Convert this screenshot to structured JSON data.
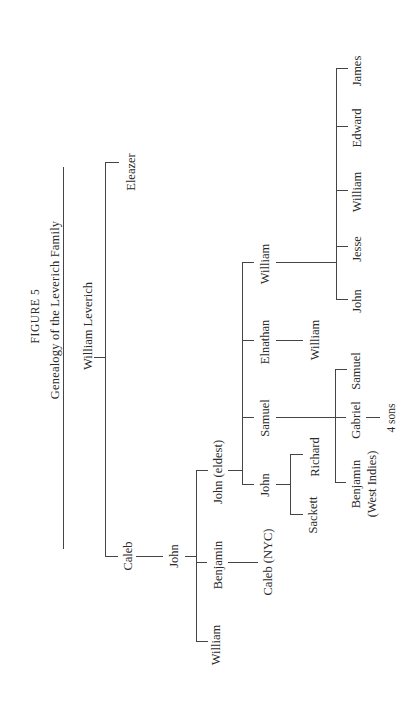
{
  "figure": {
    "number_label": "FIGURE 5",
    "title": "Genealogy of the Leverich Family",
    "orientation": "rotated 90° counter-clockwise"
  },
  "people": {
    "root": "William Leverich",
    "eleazer": "Eleazer",
    "caleb": "Caleb",
    "john_gen3": "John",
    "william_gen4": "William",
    "benjamin_gen4": "Benjamin",
    "caleb_nyc": "Caleb (NYC)",
    "john_eldest": "John (eldest)",
    "john_gen5": "John",
    "sackett": "Sackett",
    "richard": "Richard",
    "samuel_gen5": "Samuel",
    "benjamin_wi_line1": "Benjamin",
    "benjamin_wi_line2": "(West Indies)",
    "gabriel": "Gabriel",
    "four_sons": "4 sons",
    "samuel_gen6": "Samuel",
    "elnathan": "Elnathan",
    "william_son_of_elnathan": "William",
    "william_gen5": "William",
    "john_gen6": "John",
    "jesse": "Jesse",
    "william_gen6": "William",
    "edward": "Edward",
    "james": "James"
  },
  "tree": {
    "name": "William Leverich",
    "children": [
      {
        "name": "Eleazer"
      },
      {
        "name": "Caleb",
        "children": [
          {
            "name": "John",
            "children": [
              {
                "name": "William"
              },
              {
                "name": "Benjamin",
                "children": [
                  {
                    "name": "Caleb (NYC)"
                  }
                ]
              },
              {
                "name": "John (eldest)",
                "children": [
                  {
                    "name": "John",
                    "children": [
                      {
                        "name": "Sackett"
                      },
                      {
                        "name": "Richard"
                      }
                    ]
                  },
                  {
                    "name": "Samuel",
                    "children": [
                      {
                        "name": "Benjamin (West Indies)"
                      },
                      {
                        "name": "Gabriel",
                        "children": [
                          {
                            "name": "4 sons"
                          }
                        ]
                      },
                      {
                        "name": "Samuel"
                      }
                    ]
                  },
                  {
                    "name": "Elnathan",
                    "children": [
                      {
                        "name": "William"
                      }
                    ]
                  },
                  {
                    "name": "William",
                    "children": [
                      {
                        "name": "John"
                      },
                      {
                        "name": "Jesse"
                      },
                      {
                        "name": "William"
                      },
                      {
                        "name": "Edward"
                      },
                      {
                        "name": "James"
                      }
                    ]
                  }
                ]
              }
            ]
          }
        ]
      }
    ]
  },
  "colors": {
    "line": "#444444",
    "text": "#2a2a2a",
    "background": "#ffffff"
  }
}
